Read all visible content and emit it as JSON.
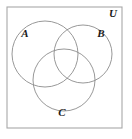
{
  "figure": {
    "kind": "venn-diagram",
    "background_color": "#ffffff",
    "stroke_color": "#8c8c8c",
    "border_color": "#a8a8a8",
    "label_color": "#1a1a1a"
  },
  "universe": {
    "label": "U",
    "label_x": 113,
    "label_y": 17,
    "rect": {
      "x": 7,
      "y": 7,
      "width": 115,
      "height": 121
    }
  },
  "sets": [
    {
      "id": "set-a",
      "label": "A",
      "label_x": 25,
      "label_y": 37,
      "cx": 45,
      "cy": 54,
      "r": 33
    },
    {
      "id": "set-b",
      "label": "B",
      "label_x": 101,
      "label_y": 37,
      "cx": 83,
      "cy": 54,
      "r": 29
    },
    {
      "id": "set-c",
      "label": "C",
      "label_x": 62,
      "label_y": 116,
      "cx": 64,
      "cy": 80,
      "r": 31
    }
  ]
}
